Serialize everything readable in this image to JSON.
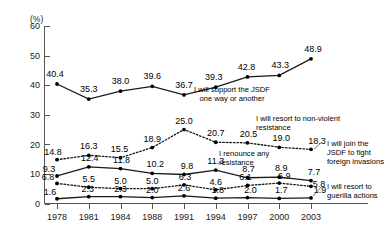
{
  "chart_data": {
    "type": "line",
    "title": "",
    "xlabel": "",
    "ylabel": "(%)",
    "unit_label": "(%)",
    "categories": [
      "1978",
      "1981",
      "1984",
      "1988",
      "1991",
      "1994",
      "1997",
      "2000",
      "2003"
    ],
    "ylim": [
      0,
      60
    ],
    "yticks": [
      "0",
      "10",
      "20",
      "30",
      "40",
      "50",
      "60"
    ],
    "grid": false,
    "legend_position": "inline-annotations",
    "series": [
      {
        "name": "I will support the JSDF one way or another",
        "style": "solid",
        "values": [
          40.4,
          35.3,
          38.0,
          39.6,
          36.7,
          39.3,
          42.8,
          43.3,
          48.9
        ],
        "labels": [
          "40.4",
          "35.3",
          "38.0",
          "39.6",
          "36.7",
          "39.3",
          "42.8",
          "43.3",
          "48.9"
        ]
      },
      {
        "name": "I will resort to non-violent resistance",
        "style": "dotted",
        "values": [
          14.8,
          16.3,
          15.5,
          18.9,
          25.0,
          20.7,
          20.5,
          19.0,
          18.3
        ],
        "labels": [
          "14.8",
          "16.3",
          "15.5",
          "18.9",
          "25.0",
          "20.7",
          "20.5",
          "19.0",
          "18.3"
        ]
      },
      {
        "name": "I will join the JSDF to fight foreign invasions",
        "style": "solid",
        "values": [
          9.3,
          12.4,
          11.8,
          10.2,
          9.8,
          11.3,
          8.7,
          8.9,
          7.7
        ],
        "labels": [
          "9.3",
          "12.4",
          "11.8",
          "10.2",
          "9.8",
          "11.3",
          "8.7",
          "8.9",
          "7.7"
        ]
      },
      {
        "name": "I renounce any resistance",
        "style": "dotted",
        "values": [
          6.8,
          5.5,
          5.0,
          5.0,
          6.3,
          4.6,
          6.1,
          6.9,
          5.8
        ],
        "labels": [
          "6.8",
          "5.5",
          "5.0",
          "5.0",
          "6.3",
          "4.6",
          "6.1",
          "6.9",
          "5.8"
        ]
      },
      {
        "name": "I will resort to guerilla actions",
        "style": "solid",
        "values": [
          1.6,
          2.3,
          2.3,
          2.0,
          2.6,
          1.8,
          2.0,
          1.7,
          1.9
        ],
        "labels": [
          "1.6",
          "2.3",
          "2.3",
          "2.0",
          "2.6",
          "1.8",
          "2.0",
          "1.7",
          "1.9"
        ]
      }
    ],
    "annotations": [
      {
        "id": "a1",
        "lines": [
          "I will support the JSDF",
          "one way or another"
        ]
      },
      {
        "id": "a2",
        "lines": [
          "I will resort to non-violent",
          "resistance"
        ]
      },
      {
        "id": "a3",
        "lines": [
          "I renounce any",
          "resistance"
        ]
      },
      {
        "id": "a4",
        "lines": [
          "I will join the",
          "JSDF to fight",
          "foreign invasions"
        ]
      },
      {
        "id": "a5",
        "lines": [
          "I will resort to",
          "guerilla actions"
        ]
      }
    ],
    "colors": {
      "line": "#1a1a1a",
      "axis": "#555555",
      "text": "#000000",
      "background": "#ffffff"
    }
  }
}
